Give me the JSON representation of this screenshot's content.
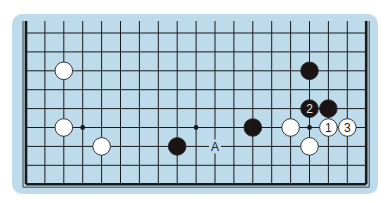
{
  "board": {
    "columns": 19,
    "rows": 9,
    "origin_x": 26,
    "origin_y": 33,
    "spacing": 18.9,
    "open_top_edge": true,
    "colors": {
      "background": "#bddbea",
      "line": "#1a1a1a",
      "black_stone": "#1a1414",
      "white_stone": "#ffffff"
    }
  },
  "star_points": [
    {
      "col": 3,
      "row": 5
    },
    {
      "col": 9,
      "row": 5
    },
    {
      "col": 15,
      "row": 5
    }
  ],
  "stones": [
    {
      "color": "white",
      "col": 2,
      "row": 2,
      "label": ""
    },
    {
      "color": "white",
      "col": 2,
      "row": 5,
      "label": ""
    },
    {
      "color": "white",
      "col": 4,
      "row": 6,
      "label": ""
    },
    {
      "color": "black",
      "col": 8,
      "row": 6,
      "label": ""
    },
    {
      "color": "black",
      "col": 12,
      "row": 5,
      "label": ""
    },
    {
      "color": "white",
      "col": 14,
      "row": 5,
      "label": ""
    },
    {
      "color": "white",
      "col": 15,
      "row": 6,
      "label": ""
    },
    {
      "color": "black",
      "col": 15,
      "row": 2,
      "label": ""
    },
    {
      "color": "black",
      "col": 15,
      "row": 4,
      "label": "2"
    },
    {
      "color": "black",
      "col": 16,
      "row": 4,
      "label": ""
    },
    {
      "color": "white",
      "col": 16,
      "row": 5,
      "label": "1"
    },
    {
      "color": "white",
      "col": 17,
      "row": 5,
      "label": "3"
    }
  ],
  "markers": [
    {
      "col": 10,
      "row": 6,
      "text": "A"
    }
  ]
}
